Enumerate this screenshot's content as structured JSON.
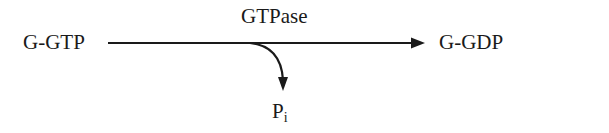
{
  "diagram": {
    "type": "reaction-scheme",
    "reactant": "G-GTP",
    "product": "G-GDP",
    "enzyme": "GTPase",
    "byproduct": {
      "base": "P",
      "subscript": "i"
    },
    "colors": {
      "stroke": "#1a1a1a",
      "background": "#ffffff"
    }
  }
}
